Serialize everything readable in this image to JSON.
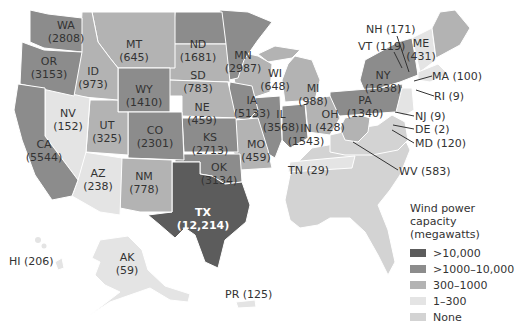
{
  "legend": {
    "title_line1": "Wind power capacity",
    "title_line2": "(megawatts)",
    "items": [
      {
        "label": ">10,000",
        "color": "#5c5c5c"
      },
      {
        "label": ">1000–10,000",
        "color": "#8c8c8c"
      },
      {
        "label": "300–1000",
        "color": "#b3b3b3"
      },
      {
        "label": "1–300",
        "color": "#e4e4e4"
      },
      {
        "label": "None",
        "color": "#d3d3d3"
      }
    ]
  },
  "states": {
    "WA": {
      "abbr": "WA",
      "value": "(2808)"
    },
    "OR": {
      "abbr": "OR",
      "value": "(3153)"
    },
    "CA": {
      "abbr": "CA",
      "value": "(5544)"
    },
    "ID": {
      "abbr": "ID",
      "value": "(973)"
    },
    "NV": {
      "abbr": "NV",
      "value": "(152)"
    },
    "MT": {
      "abbr": "MT",
      "value": "(645)"
    },
    "WY": {
      "abbr": "WY",
      "value": "(1410)"
    },
    "UT": {
      "abbr": "UT",
      "value": "(325)"
    },
    "AZ": {
      "abbr": "AZ",
      "value": "(238)"
    },
    "CO": {
      "abbr": "CO",
      "value": "(2301)"
    },
    "NM": {
      "abbr": "NM",
      "value": "(778)"
    },
    "ND": {
      "abbr": "ND",
      "value": "(1681)"
    },
    "SD": {
      "abbr": "SD",
      "value": "(783)"
    },
    "NE": {
      "abbr": "NE",
      "value": "(459)"
    },
    "KS": {
      "abbr": "KS",
      "value": "(2713)"
    },
    "OK": {
      "abbr": "OK",
      "value": "(3134)"
    },
    "TX": {
      "abbr": "TX",
      "value": "(12,214)"
    },
    "MN": {
      "abbr": "MN",
      "value": "(2987)"
    },
    "IA": {
      "abbr": "IA",
      "value": "(5133)"
    },
    "MO": {
      "abbr": "MO",
      "value": "(459)"
    },
    "WI": {
      "abbr": "WI",
      "value": "(648)"
    },
    "IL": {
      "abbr": "IL",
      "value": "(3568)"
    },
    "MI": {
      "abbr": "MI",
      "value": "(988)"
    },
    "IN": {
      "abbr": "IN",
      "value": "(1543)"
    },
    "OH": {
      "abbr": "OH",
      "value": "(428)"
    },
    "PA": {
      "abbr": "PA",
      "value": "(1340)"
    },
    "NY": {
      "abbr": "NY",
      "value": "(1638)"
    },
    "ME": {
      "abbr": "ME",
      "value": "(431)"
    }
  },
  "callouts": {
    "NH": "NH (171)",
    "VT": "VT (119)",
    "MA": "MA (100)",
    "RI": "RI (9)",
    "NJ": "NJ (9)",
    "DE": "DE (2)",
    "MD": "MD (120)",
    "WV": "WV (583)",
    "TN": "TN (29)",
    "HI": "HI (206)",
    "AK_abbr": "AK",
    "AK_value": "(59)",
    "PR": "PR (125)"
  }
}
